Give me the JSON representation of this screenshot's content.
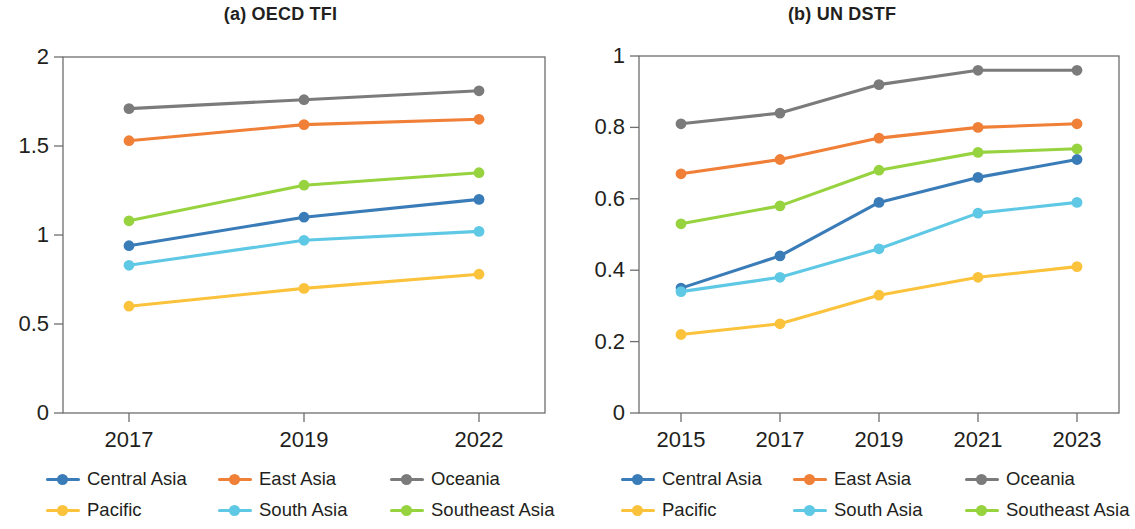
{
  "figure": {
    "panels": [
      {
        "id": "panel-a",
        "title": "(a) OECD TFI"
      },
      {
        "id": "panel-b",
        "title": "(b) UN DSTF"
      }
    ],
    "legend": {
      "items": [
        {
          "label": "Central Asia",
          "color": "#3a7cb8"
        },
        {
          "label": "East Asia",
          "color": "#f07f37"
        },
        {
          "label": "Oceania",
          "color": "#7b7b7b"
        },
        {
          "label": "Pacific",
          "color": "#fbc23c"
        },
        {
          "label": "South Asia",
          "color": "#5ec8e5"
        },
        {
          "label": "Southeast Asia",
          "color": "#97d33f"
        }
      ]
    }
  },
  "chart_data": [
    {
      "type": "line",
      "title": "(a) OECD TFI",
      "xlabel": "",
      "ylabel": "",
      "categories": [
        "2017",
        "2019",
        "2022"
      ],
      "x": [
        2017,
        2019,
        2022
      ],
      "ylim": [
        0,
        2
      ],
      "yticks": [
        0,
        0.5,
        1,
        1.5,
        2
      ],
      "ytick_labels": [
        "0",
        "0.5",
        "1",
        "1.5",
        "2"
      ],
      "grid": false,
      "legend_position": "bottom",
      "series": [
        {
          "name": "Central Asia",
          "color": "#3a7cb8",
          "values": [
            0.94,
            1.1,
            1.2
          ]
        },
        {
          "name": "East Asia",
          "color": "#f07f37",
          "values": [
            1.53,
            1.62,
            1.65
          ]
        },
        {
          "name": "Oceania",
          "color": "#7b7b7b",
          "values": [
            1.71,
            1.76,
            1.81
          ]
        },
        {
          "name": "Pacific",
          "color": "#fbc23c",
          "values": [
            0.6,
            0.7,
            0.78
          ]
        },
        {
          "name": "South Asia",
          "color": "#5ec8e5",
          "values": [
            0.83,
            0.97,
            1.02
          ]
        },
        {
          "name": "Southeast Asia",
          "color": "#97d33f",
          "values": [
            1.08,
            1.28,
            1.35
          ]
        }
      ]
    },
    {
      "type": "line",
      "title": "(b) UN DSTF",
      "xlabel": "",
      "ylabel": "",
      "categories": [
        "2015",
        "2017",
        "2019",
        "2021",
        "2023"
      ],
      "x": [
        2015,
        2017,
        2019,
        2021,
        2023
      ],
      "ylim": [
        0,
        1
      ],
      "yticks": [
        0,
        0.2,
        0.4,
        0.6,
        0.8,
        1
      ],
      "ytick_labels": [
        "0",
        "0.2",
        "0.4",
        "0.6",
        "0.8",
        "1"
      ],
      "grid": false,
      "legend_position": "bottom",
      "series": [
        {
          "name": "Central Asia",
          "color": "#3a7cb8",
          "values": [
            0.35,
            0.44,
            0.59,
            0.66,
            0.71
          ]
        },
        {
          "name": "East Asia",
          "color": "#f07f37",
          "values": [
            0.67,
            0.71,
            0.77,
            0.8,
            0.81
          ]
        },
        {
          "name": "Oceania",
          "color": "#7b7b7b",
          "values": [
            0.81,
            0.84,
            0.92,
            0.96,
            0.96
          ]
        },
        {
          "name": "Pacific",
          "color": "#fbc23c",
          "values": [
            0.22,
            0.25,
            0.33,
            0.38,
            0.41
          ]
        },
        {
          "name": "South Asia",
          "color": "#5ec8e5",
          "values": [
            0.34,
            0.38,
            0.46,
            0.56,
            0.59
          ]
        },
        {
          "name": "Southeast Asia",
          "color": "#97d33f",
          "values": [
            0.53,
            0.58,
            0.68,
            0.73,
            0.74
          ]
        }
      ]
    }
  ]
}
